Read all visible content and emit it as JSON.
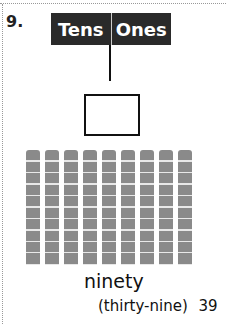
{
  "problem": {
    "number": "9.",
    "header": {
      "tens": "Tens",
      "ones": "Ones"
    },
    "answer_box_value": "",
    "model": {
      "ten_rods": 9,
      "ones_cubes": 0
    },
    "word": "ninety",
    "page_hint": "(thirty-nine)",
    "page_number": "39"
  }
}
